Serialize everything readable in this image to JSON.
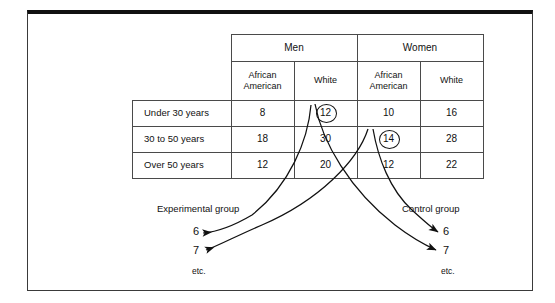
{
  "figure": {
    "table": {
      "group_headers": [
        {
          "label": "Men"
        },
        {
          "label": "Women"
        }
      ],
      "sub_headers": [
        {
          "label": "African\nAmerican",
          "line1": "African",
          "line2": "American"
        },
        {
          "label": "White",
          "line1": "White",
          "line2": ""
        },
        {
          "label": "African\nAmerican",
          "line1": "African",
          "line2": "American"
        },
        {
          "label": "White",
          "line1": "White",
          "line2": ""
        }
      ],
      "rows": [
        {
          "label": "Under 30 years",
          "cells": [
            "8",
            "12",
            "10",
            "16"
          ]
        },
        {
          "label": "30 to 50 years",
          "cells": [
            "18",
            "30",
            "14",
            "28"
          ]
        },
        {
          "label": "Over 50 years",
          "cells": [
            "12",
            "20",
            "12",
            "22"
          ]
        }
      ],
      "highlighted": [
        {
          "value": "12",
          "row": "Under 30 years",
          "column": "Men / White"
        },
        {
          "value": "14",
          "row": "30 to 50 years",
          "column": "Women / African American"
        }
      ]
    },
    "flow": {
      "left_group_label": "Experimental group",
      "right_group_label": "Control group",
      "left_destinations": [
        "6",
        "7"
      ],
      "right_destinations": [
        "6",
        "7"
      ],
      "left_etc": "etc.",
      "right_etc": "etc."
    },
    "colors": {
      "ink": "#111111",
      "grid": "#4a4a4a",
      "frame": "#3a3a3a",
      "page": "#ffffff"
    }
  }
}
